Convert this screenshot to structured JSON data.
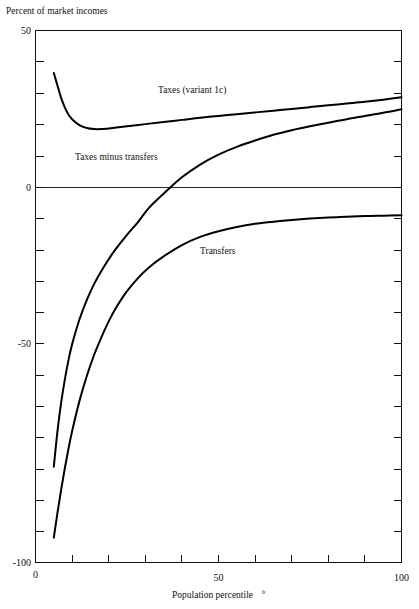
{
  "figure": {
    "title": "Percent of market incomes",
    "background_color": "#ffffff",
    "line_color": "#000000"
  },
  "chart_data": {
    "type": "line",
    "title": "Percent of market incomes",
    "xlabel": "Population percentile",
    "xlabel_footnote": "b",
    "ylabel": "Percent of market incomes",
    "xlim": [
      0,
      100
    ],
    "ylim": [
      -100,
      50
    ],
    "grid": false,
    "legend": "inline-labels",
    "x_ticks": [
      0,
      10,
      20,
      30,
      40,
      50,
      60,
      70,
      80,
      90,
      100
    ],
    "x_tick_labels": [
      "0",
      "",
      "",
      "",
      "",
      "50",
      "",
      "",
      "",
      "",
      "100"
    ],
    "y_ticks": [
      50,
      40,
      30,
      20,
      10,
      0,
      -10,
      -20,
      -30,
      -40,
      -50,
      -60,
      -70,
      -80,
      -90,
      -100
    ],
    "y_tick_labels": [
      "50",
      "",
      "",
      "",
      "",
      "0",
      "",
      "",
      "",
      "",
      "-50",
      "",
      "",
      "",
      "",
      "-100"
    ],
    "zero_reference_line": 0,
    "series": [
      {
        "name": "Taxes (variant 1c)",
        "label_x": 47,
        "label_y": 35,
        "x": [
          5,
          6,
          7,
          8,
          9,
          10,
          12,
          14,
          16,
          18,
          20,
          25,
          30,
          35,
          40,
          45,
          50,
          55,
          60,
          65,
          70,
          75,
          80,
          85,
          90,
          95,
          100
        ],
        "y": [
          38.0,
          34.5,
          31.0,
          28.3,
          26.3,
          25.0,
          23.3,
          22.5,
          22.2,
          22.2,
          22.4,
          23.0,
          23.6,
          24.2,
          24.8,
          25.4,
          25.9,
          26.4,
          26.9,
          27.4,
          27.9,
          28.4,
          28.9,
          29.4,
          29.9,
          30.5,
          31.2
        ]
      },
      {
        "name": "Taxes minus transfers",
        "label_x": 17,
        "label_y": 9,
        "x": [
          5,
          6,
          7,
          8,
          9,
          10,
          12,
          14,
          16,
          18,
          20,
          22,
          25,
          28,
          31,
          35,
          40,
          45,
          50,
          55,
          60,
          65,
          70,
          75,
          80,
          85,
          90,
          95,
          100
        ],
        "y": [
          -73.0,
          -63.0,
          -55.0,
          -48.5,
          -43.0,
          -38.5,
          -31.5,
          -26.0,
          -21.5,
          -17.8,
          -14.5,
          -11.5,
          -7.6,
          -4.0,
          0.0,
          4.0,
          8.6,
          12.2,
          15.0,
          17.2,
          19.0,
          20.6,
          21.9,
          23.0,
          24.0,
          25.0,
          25.9,
          26.8,
          27.8
        ]
      },
      {
        "name": "Transfers",
        "label_x": 57,
        "label_y": -20,
        "x": [
          5,
          6,
          7,
          8,
          9,
          10,
          12,
          14,
          16,
          18,
          20,
          22,
          25,
          28,
          31,
          35,
          40,
          45,
          50,
          55,
          60,
          65,
          70,
          75,
          80,
          85,
          90,
          95,
          100
        ],
        "y": [
          -93.0,
          -86.0,
          -79.5,
          -73.5,
          -68.0,
          -63.0,
          -54.5,
          -47.5,
          -41.5,
          -36.5,
          -32.0,
          -28.2,
          -23.5,
          -19.8,
          -16.8,
          -13.7,
          -10.5,
          -8.2,
          -6.6,
          -5.4,
          -4.5,
          -3.9,
          -3.4,
          -3.0,
          -2.7,
          -2.5,
          -2.3,
          -2.2,
          -2.1
        ]
      }
    ]
  },
  "labels": {
    "y_axis_title": "Percent of market incomes",
    "y_top": "50",
    "y_zero": "0",
    "y_minus_fifty": "-50",
    "y_minus_hundred": "-100",
    "x_zero": "0",
    "x_fifty": "50",
    "x_hundred": "100",
    "x_axis_title": "Population percentile",
    "x_axis_footnote": "b",
    "curve_taxes": "Taxes (variant 1c)",
    "curve_taxes_minus_transfers": "Taxes minus transfers",
    "curve_transfers": "Transfers"
  }
}
